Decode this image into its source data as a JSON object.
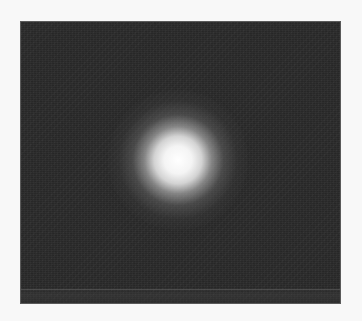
{
  "image": {
    "subject": "glowing orb",
    "description": "Grayscale photograph of a bright diffuse circular light source centered on a dark noisy background",
    "colors": {
      "page_background": "#f8f8f8",
      "photo_background": "#2a2a2a",
      "orb_core": "#ffffff",
      "orb_halo": "#8a8a8a"
    },
    "orb": {
      "center_x": 178,
      "center_y": 160,
      "core_radius": 30,
      "halo_radius": 70
    }
  }
}
